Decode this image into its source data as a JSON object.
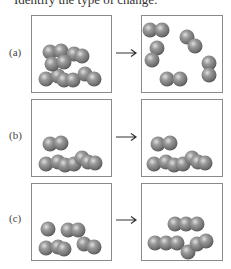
{
  "prompt": "Identify the type of change:",
  "panels": [
    {
      "label": "(a)",
      "before": "particles packed at bottom (solid/liquid)",
      "after": "separated diatomic molecules (gas)"
    },
    {
      "label": "(b)",
      "before": "particles packed at bottom",
      "after": "same arrangement of particles"
    },
    {
      "label": "(c)",
      "before": "particles packed at bottom",
      "after": "particles rearranged into chains"
    }
  ],
  "colors": {
    "sphere": "#8c8c8c",
    "sphere_highlight": "#d8d8d8",
    "sphere_shadow": "#4a4a4a",
    "box_border": "#8a8a8a"
  }
}
